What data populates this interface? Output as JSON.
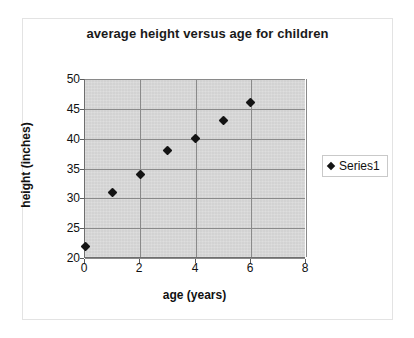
{
  "chart_data": {
    "type": "scatter",
    "title": "average height versus age for children",
    "xlabel": "age (years)",
    "ylabel": "height (inches)",
    "xlim": [
      0,
      8
    ],
    "ylim": [
      20,
      50
    ],
    "xticks": [
      "0",
      "2",
      "4",
      "6",
      "8"
    ],
    "xtick_values": [
      0,
      2,
      4,
      6,
      8
    ],
    "yticks": [
      "20",
      "25",
      "30",
      "35",
      "40",
      "45",
      "50"
    ],
    "ytick_values": [
      20,
      25,
      30,
      35,
      40,
      45,
      50
    ],
    "grid": true,
    "grid_axis": "both",
    "legend_position": "right",
    "plot_background": "#d6d6d6",
    "marker_color": "#141414",
    "marker_shape": "diamond",
    "series": [
      {
        "name": "Series1",
        "x": [
          0,
          1,
          2,
          3,
          4,
          5,
          6
        ],
        "y": [
          22,
          31,
          34,
          38,
          40,
          43,
          46
        ],
        "points": [
          {
            "x": 0,
            "y": 22
          },
          {
            "x": 1,
            "y": 31
          },
          {
            "x": 2,
            "y": 34
          },
          {
            "x": 3,
            "y": 38
          },
          {
            "x": 4,
            "y": 40
          },
          {
            "x": 5,
            "y": 43
          },
          {
            "x": 6,
            "y": 46
          }
        ]
      }
    ]
  },
  "legend": {
    "entries": [
      {
        "label": "Series1"
      }
    ]
  }
}
